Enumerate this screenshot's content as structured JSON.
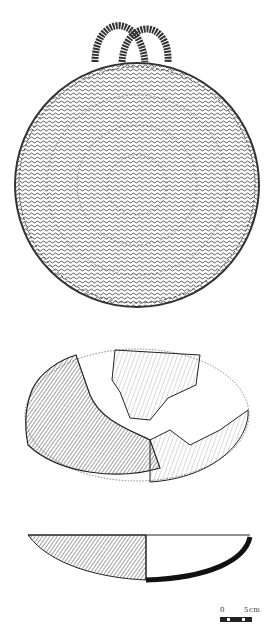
{
  "figure": {
    "items": [
      {
        "name": "basket-lid",
        "description": "Coiled basket lid with two loop handles"
      },
      {
        "name": "bowl-top-view",
        "description": "Fragmentary bowl, plan view with reconstructed outline"
      },
      {
        "name": "bowl-section",
        "description": "Bowl profile with cross-section"
      }
    ],
    "colors": {
      "ink": "#222222",
      "background": "#ffffff"
    }
  },
  "scale_bar": {
    "zero_label": "0",
    "unit_label": "5cm"
  }
}
